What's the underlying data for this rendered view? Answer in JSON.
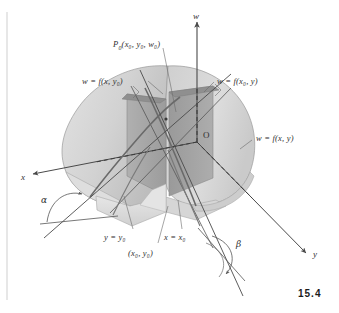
{
  "figure": {
    "number": "15.4",
    "caption_axes": {
      "x_axis": "x",
      "y_axis": "y",
      "w_axis": "w",
      "origin": "O"
    },
    "point_label": "P",
    "point_sub": "0",
    "point_coords": "(x₀, y₀, w₀)",
    "labels": {
      "surface": "w = f(x, y)",
      "trace_x": "w = f(x, y₀)",
      "trace_y": "w = f(x₀, y)",
      "plane_y": "y = y₀",
      "plane_x": "x = x₀",
      "base_point": "(x₀, y₀)",
      "angle_alpha": "α",
      "angle_beta": "β"
    },
    "colors": {
      "surface_light": "#d8d8d8",
      "surface_mid": "#c2c2c2",
      "surface_dark": "#a6a6a6",
      "plane_dark": "#9d9d9d",
      "plane_mid": "#b5b5b5",
      "line": "#4a4a4a",
      "text": "#2f2f2f"
    }
  }
}
